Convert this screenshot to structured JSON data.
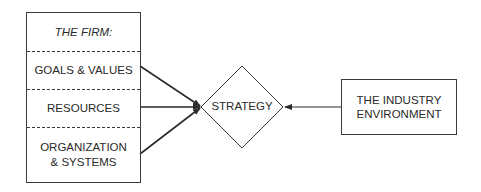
{
  "diagram": {
    "firm": {
      "title": "THE FIRM:",
      "sections": [
        {
          "label": "GOALS & VALUES"
        },
        {
          "label": "RESOURCES"
        },
        {
          "label_line1": "ORGANIZATION",
          "label_line2": "& SYSTEMS"
        }
      ]
    },
    "strategy": {
      "label": "STRATEGY"
    },
    "industry": {
      "label_line1": "THE INDUSTRY",
      "label_line2": "ENVIRONMENT"
    },
    "edges": [
      {
        "from": "GOALS & VALUES",
        "to": "STRATEGY"
      },
      {
        "from": "RESOURCES",
        "to": "STRATEGY"
      },
      {
        "from": "ORGANIZATION & SYSTEMS",
        "to": "STRATEGY"
      },
      {
        "from": "THE INDUSTRY ENVIRONMENT",
        "to": "STRATEGY"
      }
    ],
    "colors": {
      "line": "#2a2a2a",
      "background": "#ffffff"
    }
  }
}
